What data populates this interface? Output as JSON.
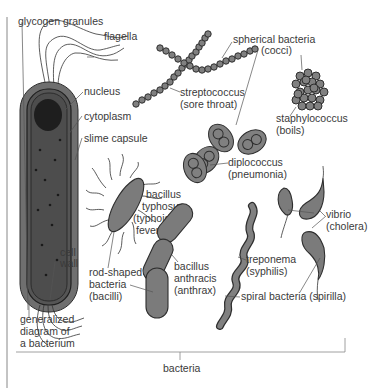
{
  "diagram": {
    "title": "bacteria",
    "colors": {
      "cell_fill": "#7b7b7b",
      "outline": "#2e2e2e",
      "capsule": "#6f6f6f",
      "text": "#3a3a3a"
    },
    "general": {
      "caption": [
        "generalized",
        "diagram of",
        "a bacterium"
      ],
      "parts": {
        "glycogen": "glycogen granules",
        "flagella": "flagella",
        "nucleus": "nucleus",
        "cytoplasm": "cytoplasm",
        "slime": "slime capsule",
        "cellwall": [
          "cell",
          "wall"
        ]
      }
    },
    "spherical": {
      "group": [
        "spherical bacteria",
        "(cocci)"
      ],
      "strepto": [
        "streptococcus",
        "(sore throat)"
      ],
      "staph": [
        "staphylococcus",
        "(boils)"
      ],
      "diplo": [
        "diplococcus",
        "(pneumonia)"
      ]
    },
    "rod": {
      "group": [
        "rod-shaped",
        "bacteria",
        "(bacilli)"
      ],
      "typhosus": [
        "bacillus",
        "typhosus",
        "(typhoid",
        "fever)"
      ],
      "anthracis": [
        "bacillus",
        "anthracis",
        "(anthrax)"
      ]
    },
    "spiral": {
      "group": "spiral bacteria (spirilla)",
      "treponema": [
        "treponema",
        "(syphilis)"
      ],
      "vibrio": [
        "vibrio",
        "(cholera)"
      ]
    }
  }
}
